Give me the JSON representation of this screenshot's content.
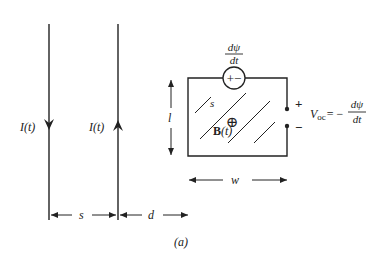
{
  "figure": {
    "caption": "(a)",
    "wires": [
      {
        "current_label": "I(t)",
        "direction": "down"
      },
      {
        "current_label": "I(t)",
        "direction": "up"
      }
    ],
    "dimensions": {
      "wire_spacing": "s",
      "loop_offset": "d",
      "loop_width": "w",
      "loop_length": "l"
    },
    "loop": {
      "area_label": "s",
      "field_label_bold": "B",
      "field_label_arg": "(t)",
      "field_symbol": "⊕",
      "source_symbol": "+−",
      "emf_numerator": "dψ",
      "emf_denominator": "dt"
    },
    "terminals": {
      "plus": "+",
      "minus": "−"
    },
    "voc": {
      "label": "V",
      "subscript": "oc",
      "equals": "= −",
      "numerator": "dψ",
      "denominator": "dt"
    },
    "colors": {
      "stroke": "#222222",
      "background": "#ffffff"
    }
  }
}
